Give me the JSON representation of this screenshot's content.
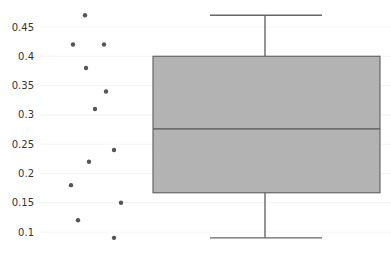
{
  "chart_data": {
    "type": "box",
    "title": "",
    "xlabel": "",
    "ylabel": "",
    "ylim": [
      0.07,
      0.49
    ],
    "grid": true,
    "legend": null,
    "y_ticks": [
      0.1,
      0.15,
      0.2,
      0.25,
      0.3,
      0.35,
      0.4,
      0.45
    ],
    "y_tick_labels": [
      "0.1",
      "0.15",
      "0.2",
      "0.25",
      "0.3",
      "0.35",
      "0.4",
      "0.45"
    ],
    "points": [
      {
        "x_jitter": 85,
        "y": 0.47
      },
      {
        "x_jitter": 73,
        "y": 0.42
      },
      {
        "x_jitter": 104,
        "y": 0.42
      },
      {
        "x_jitter": 86,
        "y": 0.38
      },
      {
        "x_jitter": 106,
        "y": 0.34
      },
      {
        "x_jitter": 95,
        "y": 0.31
      },
      {
        "x_jitter": 114,
        "y": 0.24
      },
      {
        "x_jitter": 89,
        "y": 0.22
      },
      {
        "x_jitter": 71,
        "y": 0.18
      },
      {
        "x_jitter": 121,
        "y": 0.15
      },
      {
        "x_jitter": 78,
        "y": 0.12
      },
      {
        "x_jitter": 114,
        "y": 0.09
      }
    ],
    "values": [
      0.47,
      0.42,
      0.42,
      0.38,
      0.34,
      0.31,
      0.24,
      0.22,
      0.18,
      0.15,
      0.12,
      0.09
    ],
    "box": {
      "min": 0.09,
      "q1": 0.167,
      "median": 0.276,
      "q3": 0.4,
      "max": 0.47
    },
    "colors": {
      "box_fill": "#b3b3b3",
      "box_stroke": "#666666",
      "points": "#555555",
      "grid": "#f4f4f4"
    }
  }
}
